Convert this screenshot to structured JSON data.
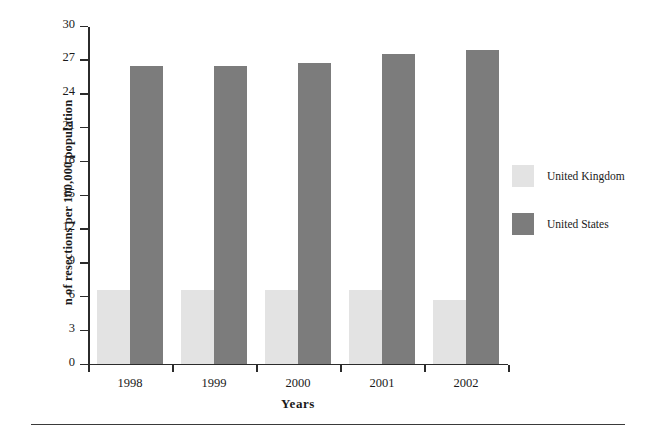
{
  "chart_data": {
    "type": "bar",
    "title": "",
    "xlabel": "Years",
    "ylabel": "n of resections per 100,000 population",
    "categories": [
      "1998",
      "1999",
      "2000",
      "2001",
      "2002"
    ],
    "series": [
      {
        "name": "United Kingdom",
        "color": "#e3e3e3",
        "values": [
          6.5,
          6.5,
          6.5,
          6.5,
          5.6
        ]
      },
      {
        "name": "United States",
        "color": "#7c7c7c",
        "values": [
          26.4,
          26.4,
          26.7,
          27.5,
          27.8
        ]
      }
    ],
    "ylim": [
      0,
      30
    ],
    "yticks": [
      0,
      3,
      6,
      9,
      12,
      15,
      18,
      21,
      24,
      27,
      30
    ],
    "ytick_labels": [
      "0",
      "3",
      "6",
      "9",
      "12",
      "15",
      "18",
      "21",
      "24",
      "27",
      "30"
    ],
    "grid": false,
    "legend_position": "right"
  },
  "legend": {
    "entries": [
      {
        "label": "United Kingdom"
      },
      {
        "label": "United States"
      }
    ]
  }
}
